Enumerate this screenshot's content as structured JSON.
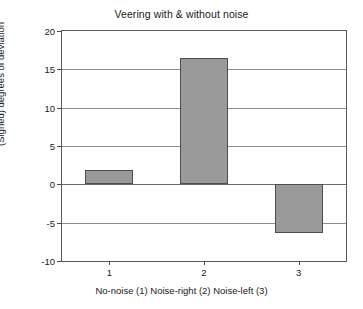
{
  "chart_data": {
    "type": "bar",
    "title": "Veering with & without noise",
    "xlabel": "No-noise (1) Noise-right (2) Noise-left (3)",
    "ylabel": "(Signed) degrees of deviation",
    "categories": [
      "1",
      "2",
      "3"
    ],
    "category_descriptions": [
      "No-noise (1)",
      "Noise-right (2)",
      "Noise-left (3)"
    ],
    "values": [
      1.9,
      16.5,
      -6.3
    ],
    "ylim": [
      -10,
      20
    ],
    "yticks": [
      20,
      15,
      10,
      5,
      0,
      -5,
      -10
    ],
    "ytick_labels": [
      "20",
      "15",
      "10",
      "5",
      "0",
      "-5",
      "-10"
    ],
    "xticks": [
      1,
      2,
      3
    ],
    "xtick_labels": [
      "1",
      "2",
      "3"
    ],
    "grid": true,
    "grid_axis": "y",
    "legend": "none",
    "bar_color": "#9a9a9a",
    "bar_edge_color": "#4d4d4d",
    "axis_color": "#5a5a5a",
    "background_color": "#ffffff"
  }
}
